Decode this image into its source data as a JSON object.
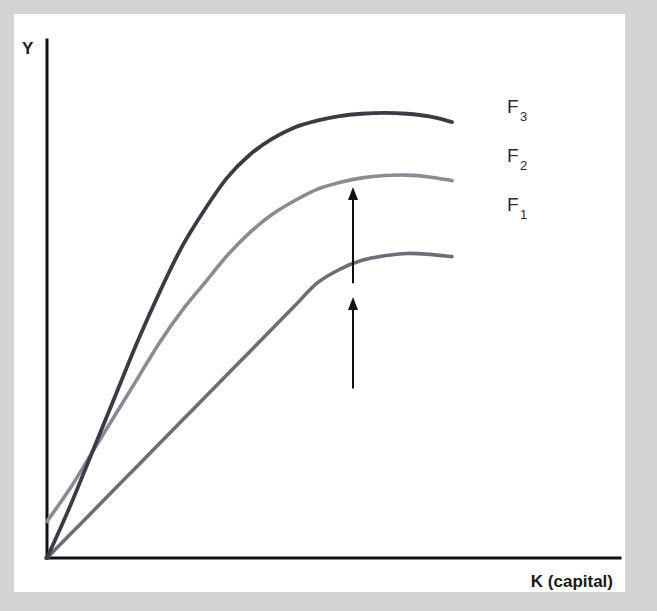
{
  "figure": {
    "background_color": "#d4d4d4",
    "card_color": "#ffffff",
    "axis_color": "#111111",
    "arrow_color": "#111111"
  },
  "axes": {
    "y_label": "Y",
    "x_label": "K (capital)"
  },
  "annotations": {
    "arrow_lower_name": "shift-arrow-f1-to-f2",
    "arrow_upper_name": "shift-arrow-f2-to-f3"
  },
  "chart_data": {
    "type": "line",
    "title": "",
    "subtitle": "",
    "xlabel": "K (capital)",
    "ylabel": "Y",
    "grid": false,
    "legend_position": "right-of-curve-ends",
    "xlim": [
      0,
      100
    ],
    "ylim": [
      0,
      100
    ],
    "x_tick_labels": [],
    "y_tick_labels": [],
    "annotations": [
      {
        "type": "arrow",
        "direction": "up",
        "from_series": "F_1",
        "to_series": "F_2",
        "x": 68,
        "y_start": 37,
        "y_end": 57
      },
      {
        "type": "arrow",
        "direction": "up",
        "from_series": "F_2",
        "to_series": "F_3",
        "x": 68,
        "y_start": 60,
        "y_end": 81
      }
    ],
    "series": [
      {
        "name": "F_1",
        "label": "F",
        "subscript": "1",
        "color": "#6d6d79",
        "stroke_width": 3.6,
        "description": "Lowest production function: output Y as concave function of capital K, peaks then flattens",
        "x": [
          0,
          5,
          10,
          15,
          20,
          25,
          30,
          35,
          40,
          45,
          50,
          55,
          60,
          65,
          70,
          75,
          80,
          85,
          90
        ],
        "y": [
          0,
          5,
          10,
          15,
          20,
          25,
          30,
          35,
          40,
          45,
          50,
          55,
          60,
          63,
          65,
          66,
          66.5,
          66.3,
          65.8
        ]
      },
      {
        "name": "F_2",
        "label": "F",
        "subscript": "2",
        "color": "#8b8b96",
        "stroke_width": 3.6,
        "description": "Middle production function: shifted up from F_1 by technology improvement",
        "x": [
          0,
          5,
          10,
          15,
          20,
          25,
          30,
          35,
          40,
          45,
          50,
          55,
          60,
          65,
          70,
          75,
          80,
          85,
          90
        ],
        "y": [
          8,
          15,
          23,
          31,
          39,
          47,
          54,
          60,
          66,
          71,
          75,
          78,
          80.5,
          82,
          83,
          83.5,
          83.6,
          83.2,
          82.4
        ]
      },
      {
        "name": "F_3",
        "label": "F",
        "subscript": "3",
        "color": "#3b3b47",
        "stroke_width": 3.8,
        "description": "Highest production function: shifted up again, steepest initial slope",
        "x": [
          0,
          5,
          10,
          15,
          20,
          25,
          30,
          35,
          40,
          45,
          50,
          55,
          60,
          65,
          70,
          75,
          80,
          85,
          90
        ],
        "y": [
          0,
          11,
          23,
          35,
          47,
          58,
          68,
          76,
          83,
          88,
          91.5,
          94,
          95.5,
          96.5,
          97,
          97.2,
          97,
          96.4,
          95.2
        ]
      }
    ]
  }
}
